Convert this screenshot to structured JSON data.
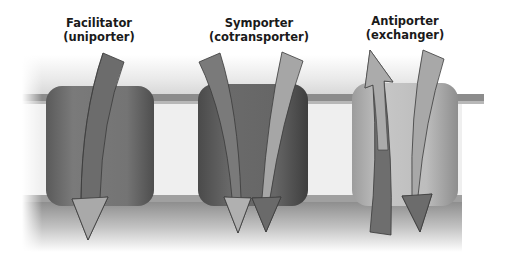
{
  "labels": {
    "facilitator": {
      "line1": "Facilitator",
      "line2": "(uniporter)"
    },
    "symporter": {
      "line1": "Symporter",
      "line2": "(cotransporter)"
    },
    "antiporter": {
      "line1": "Antiporter",
      "line2": "(exchanger)"
    }
  },
  "colors": {
    "background": "#ffffff",
    "membrane_top_band": "#8a8a8a",
    "membrane_interior": "#efefef",
    "membrane_bottom_band": "#9a9a9a",
    "facilitator_protein": "#6e6e6e",
    "symporter_protein": "#5e5e5e",
    "antiporter_protein": "#b4b4b4",
    "arrow_dark": "#6a6a6a",
    "arrow_light": "#a8a8a8",
    "arrow_outline": "#3a3a3a"
  },
  "transporters": [
    {
      "type": "facilitator",
      "arrows": [
        {
          "direction": "down",
          "shade": "dark"
        }
      ]
    },
    {
      "type": "symporter",
      "arrows": [
        {
          "direction": "down",
          "shade": "dark"
        },
        {
          "direction": "down",
          "shade": "light"
        }
      ]
    },
    {
      "type": "antiporter",
      "arrows": [
        {
          "direction": "up",
          "shade": "light"
        },
        {
          "direction": "down",
          "shade": "light"
        }
      ]
    }
  ]
}
